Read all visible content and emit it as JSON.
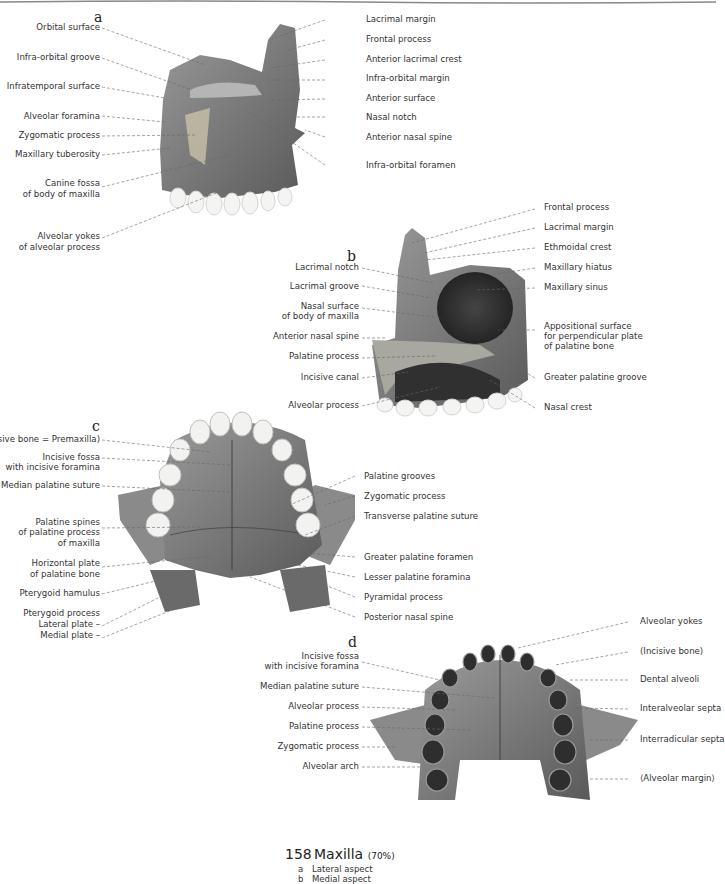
{
  "figure": {
    "number": "158",
    "title": "Maxilla",
    "scale": "(70%)",
    "subcaptions": [
      {
        "letter": "a",
        "text": "Lateral aspect"
      },
      {
        "letter": "b",
        "text": "Medial aspect"
      }
    ]
  },
  "panel_a": {
    "letter": "a",
    "left_labels": [
      "Orbital surface",
      "Infra-orbital groove",
      "Infratemporal surface",
      "Alveolar foramina",
      "Zygomatic process",
      "Maxillary tuberosity",
      "Canine fossa",
      "of body of maxilla",
      "Alveolar yokes",
      "of alveolar process"
    ],
    "right_labels": [
      "Lacrimal margin",
      "Frontal process",
      "Anterior lacrimal crest",
      "Infra-orbital margin",
      "Anterior surface",
      "Nasal notch",
      "Anterior nasal spine",
      "Infra-orbital foramen"
    ]
  },
  "panel_b": {
    "letter": "b",
    "left_labels": [
      "Lacrimal notch",
      "Lacrimal groove",
      "Nasal surface",
      "of body of maxilla",
      "Anterior nasal spine",
      "Palatine process",
      "Incisive canal",
      "Alveolar process"
    ],
    "right_labels": [
      "Frontal process",
      "Lacrimal margin",
      "Ethmoidal crest",
      "Maxillary hiatus",
      "Maxillary sinus",
      "Appositional surface",
      "for perpendicular plate",
      "of palatine bone",
      "Greater palatine groove",
      "Nasal crest"
    ]
  },
  "panel_c": {
    "letter": "c",
    "left_labels": [
      "(Incisive bone = Premaxilla)",
      "Incisive fossa",
      "with incisive foramina",
      "Median palatine suture",
      "Palatine spines",
      "of palatine process",
      "of maxilla",
      "Horizontal plate",
      "of palatine bone",
      "Pterygoid hamulus",
      "Pterygoid process",
      "Lateral plate –",
      "Medial plate –"
    ],
    "right_labels": [
      "Palatine grooves",
      "Zygomatic process",
      "Transverse palatine suture",
      "Greater palatine foramen",
      "Lesser palatine foramina",
      "Pyramidal process",
      "Posterior nasal spine"
    ]
  },
  "panel_d": {
    "letter": "d",
    "left_labels": [
      "Incisive fossa",
      "with incisive foramina",
      "Median palatine suture",
      "Alveolar process",
      "Palatine process",
      "Zygomatic process",
      "Alveolar arch"
    ],
    "right_labels": [
      "Alveolar yokes",
      "(Incisive bone)",
      "Dental alveoli",
      "Interalveolar septa",
      "Interradicular septa",
      "⟨Alveolar margin⟩"
    ]
  }
}
